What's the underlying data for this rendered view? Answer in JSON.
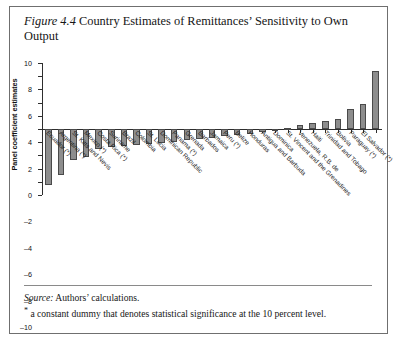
{
  "figure": {
    "label": "Figure 4.4",
    "title": "Country Estimates of Remittances’ Sensitivity to Own Output"
  },
  "notes": {
    "source_label": "Source:",
    "source_text": "Authors’ calculations.",
    "footnote_marker": "*",
    "footnote_text": "a constant dummy that denotes statistical significance at the 10 percent level."
  },
  "chart_data": {
    "type": "bar",
    "title": "Country Estimates of Remittances’ Sensitivity to Own Output",
    "xlabel": "",
    "ylabel": "Panel coefficient estimates",
    "ylim": [
      -10,
      10
    ],
    "yticks": [
      10,
      8,
      6,
      4,
      2,
      0,
      -2,
      -4,
      -6,
      -8,
      -10
    ],
    "ytick_labels": [
      "10",
      "8",
      "6",
      "4",
      "2",
      "0",
      "–2",
      "–4",
      "–6",
      "–8",
      "–10"
    ],
    "grid": false,
    "legend": "none",
    "bar_color": "#8d8d8d",
    "bar_edge_color": "#4a4a4a",
    "categories": [
      "Ecuador (*)",
      "Argentina (*)",
      "St. Kitts and Nevis",
      "Mexico (*)",
      "Costa Rica (*)",
      "Suriname",
      "Brazil",
      "Colombia",
      "St. Lucia",
      "Dominican Republic",
      "Panama (*)",
      "Grenada",
      "Barbados",
      "Jamaica",
      "Peru (*)",
      "Belize",
      "Honduras",
      "Antigua and Barbuda",
      "Dominica",
      "St. Vincent and the Grenadines",
      "Venezuela, R.B. de",
      "Haiti",
      "Trinidad and Tobago",
      "Bolivia",
      "Paraguay (*)",
      "El Salvador (*)"
    ],
    "values": [
      -8.5,
      -7.0,
      -4.7,
      -4.3,
      -3.0,
      -2.7,
      -2.6,
      -2.4,
      -2.2,
      -2.1,
      -1.9,
      -1.7,
      -1.5,
      -1.3,
      -1.1,
      -0.9,
      -0.7,
      -0.5,
      -0.3,
      0.2,
      0.6,
      0.9,
      1.2,
      1.5,
      3.0,
      3.8
    ]
  },
  "extra_bars": {
    "note": "two additional unlabeled tall positive bars at right",
    "values": [
      3.8,
      8.8
    ]
  }
}
